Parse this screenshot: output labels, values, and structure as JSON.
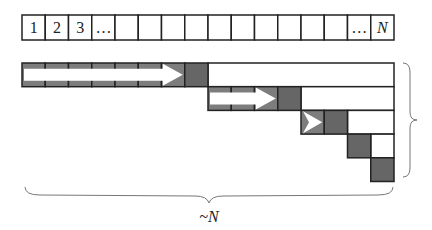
{
  "array": {
    "cell_count": 16,
    "labels": [
      "1",
      "2",
      "3",
      "…",
      "",
      "",
      "",
      "",
      "",
      "",
      "",
      "",
      "",
      "",
      "…",
      "N"
    ]
  },
  "passes": [
    {
      "start": 0,
      "arrow_cells": 7,
      "pivot": 7
    },
    {
      "start": 8,
      "arrow_cells": 3,
      "pivot": 11
    },
    {
      "start": 12,
      "arrow_cells": 1,
      "pivot": 13
    },
    {
      "start": 14,
      "arrow_cells": 0,
      "pivot": 14
    },
    {
      "start": 15,
      "arrow_cells": 0,
      "pivot": 15
    }
  ],
  "labels": {
    "bottom_brace": "~N"
  },
  "colors": {
    "cell_fill": "#7d7d7d",
    "pivot_fill": "#666666",
    "border": "#222222",
    "arrow": "#ffffff"
  }
}
